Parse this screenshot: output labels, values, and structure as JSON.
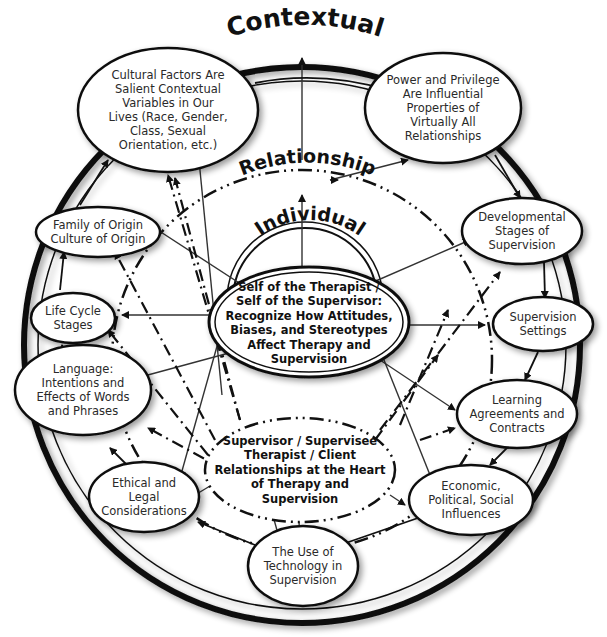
{
  "diagram": {
    "layers": {
      "contextual": "Contextual",
      "relationship": "Relationship",
      "individual": "Individual"
    },
    "core": {
      "self": "Self of the Therapist /\nSelf of the Supervisor:\nRecognize How Attitudes,\nBiases, and Stereotypes\nAffect Therapy and\nSupervision",
      "relationships": "Supervisor / Supervisee\nTherapist / Client\nRelationships at the Heart\nof Therapy and\nSupervision"
    },
    "nodes": [
      {
        "id": "cultural",
        "text": "Cultural Factors Are\nSalient Contextual\nVariables in Our\nLives (Race, Gender,\nClass, Sexual\nOrientation, etc.)"
      },
      {
        "id": "power",
        "text": "Power and Privilege\nAre Influential\nProperties of\nVirtually All\nRelationships"
      },
      {
        "id": "developmental",
        "text": "Developmental\nStages of\nSupervision"
      },
      {
        "id": "settings",
        "text": "Supervision\nSettings"
      },
      {
        "id": "learning",
        "text": "Learning\nAgreements and\nContracts"
      },
      {
        "id": "economic",
        "text": "Economic,\nPolitical, Social\nInfluences"
      },
      {
        "id": "technology",
        "text": "The Use of\nTechnology in\nSupervision"
      },
      {
        "id": "ethical",
        "text": "Ethical and\nLegal\nConsiderations"
      },
      {
        "id": "language",
        "text": "Language:\nIntentions and\nEffects of Words\nand Phrases"
      },
      {
        "id": "lifecycle",
        "text": "Life Cycle\nStages"
      },
      {
        "id": "family",
        "text": "Family of Origin\nCulture of Origin"
      }
    ]
  }
}
